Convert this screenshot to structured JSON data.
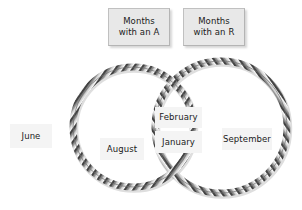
{
  "diagram": {
    "type": "venn-two-set",
    "background_color": "#ffffff",
    "rope_band_color": "#c8c8c8",
    "rope_hatch_color": "#3c3c3c",
    "header_box_color": "#e8e8e8",
    "item_box_color": "#f4f4f4",
    "text_color": "#1a1a1a"
  },
  "headers": [
    {
      "id": "set-a",
      "line1": "Months",
      "line2": "with an A"
    },
    {
      "id": "set-r",
      "line1": "Months",
      "line2": "with an R"
    }
  ],
  "items": {
    "outside": [
      {
        "label": "June"
      }
    ],
    "set_a_only": [
      {
        "label": "August"
      }
    ],
    "intersection": [
      {
        "label": "February"
      },
      {
        "label": "January"
      }
    ],
    "set_r_only": [
      {
        "label": "September"
      }
    ]
  },
  "circles": {
    "left": {
      "cx": 133,
      "cy": 127,
      "r": 60
    },
    "right": {
      "cx": 221,
      "cy": 127,
      "r": 66
    }
  }
}
